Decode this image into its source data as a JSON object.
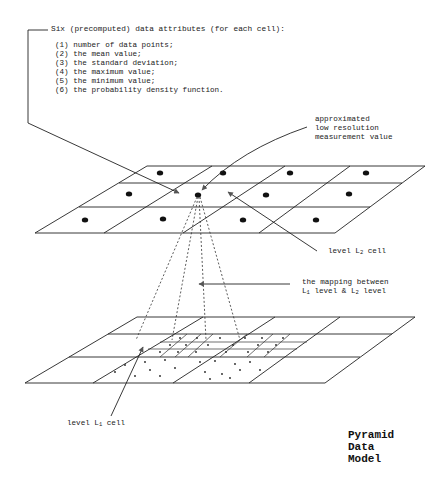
{
  "attributes": {
    "heading": "Six (precomputed) data attributes (for each cell):",
    "items": [
      "(1) number of data points;",
      "(2) the mean value;",
      "(3) the standard deviation;",
      "(4) the maximum value;",
      "(5) the minimum value;",
      "(6) the probability density function."
    ]
  },
  "labels": {
    "approx": [
      "approximated",
      "low resolution",
      "measurement value"
    ],
    "l2_cell_prefix": "level L",
    "l2_cell_sub": "2",
    "l2_cell_suffix": " cell",
    "mapping_line1": "the mapping between",
    "mapping_l1": "L",
    "mapping_l1_sub": "1",
    "mapping_mid": " level & L",
    "mapping_l2_sub": "2",
    "mapping_end": " level",
    "l1_cell_prefix": "level L",
    "l1_cell_sub": "1",
    "l1_cell_suffix": " cell"
  },
  "title": [
    "Pyramid",
    "Data",
    "Model"
  ],
  "colors": {
    "line": "#222222",
    "arrow": "#555555",
    "dot": "#111111"
  }
}
